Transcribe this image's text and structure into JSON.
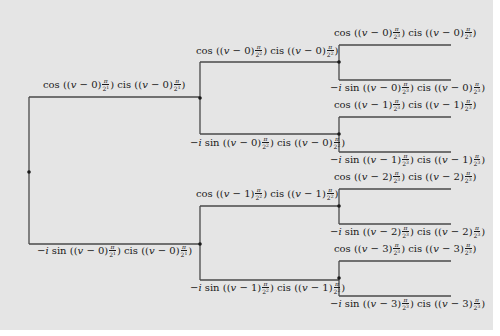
{
  "diagram": {
    "type": "binary-tree",
    "background": "#e5e5e5",
    "line_color": "#4a4a4a",
    "nodes": [
      {
        "id": "root",
        "x": 29,
        "y": 172
      },
      {
        "id": "n0",
        "x": 200,
        "y": 98
      },
      {
        "id": "n1",
        "x": 200,
        "y": 244
      },
      {
        "id": "n00",
        "x": 339,
        "y": 62
      },
      {
        "id": "n01",
        "x": 339,
        "y": 134
      },
      {
        "id": "n10",
        "x": 339,
        "y": 206
      },
      {
        "id": "n11",
        "x": 339,
        "y": 278
      }
    ],
    "labels": {
      "l1_top": {
        "prefix": "",
        "f": "cos",
        "k": "0",
        "exp": "1"
      },
      "l1_bot": {
        "prefix": "−i",
        "f": "sin",
        "k": "0",
        "exp": "1"
      },
      "l2_0_top": {
        "prefix": "",
        "f": "cos",
        "k": "0",
        "exp": "2"
      },
      "l2_0_bot": {
        "prefix": "−i",
        "f": "sin",
        "k": "0",
        "exp": "2"
      },
      "l2_1_top": {
        "prefix": "",
        "f": "cos",
        "k": "1",
        "exp": "2"
      },
      "l2_1_bot": {
        "prefix": "−i",
        "f": "sin",
        "k": "1",
        "exp": "2"
      },
      "l3_0_top": {
        "prefix": "",
        "f": "cos",
        "k": "0",
        "exp": "3"
      },
      "l3_0_bot": {
        "prefix": "−i",
        "f": "sin",
        "k": "0",
        "exp": "3"
      },
      "l3_1_top": {
        "prefix": "",
        "f": "cos",
        "k": "1",
        "exp": "3"
      },
      "l3_1_bot": {
        "prefix": "−i",
        "f": "sin",
        "k": "1",
        "exp": "3"
      },
      "l3_2_top": {
        "prefix": "",
        "f": "cos",
        "k": "2",
        "exp": "3"
      },
      "l3_2_bot": {
        "prefix": "−i",
        "f": "sin",
        "k": "2",
        "exp": "3"
      },
      "l3_3_top": {
        "prefix": "",
        "f": "cos",
        "k": "3",
        "exp": "3"
      },
      "l3_3_bot": {
        "prefix": "−i",
        "f": "sin",
        "k": "3",
        "exp": "3"
      }
    },
    "text": {
      "cis": "cis",
      "v": "v",
      "minus": "−",
      "pi": "π",
      "two": "2"
    }
  }
}
